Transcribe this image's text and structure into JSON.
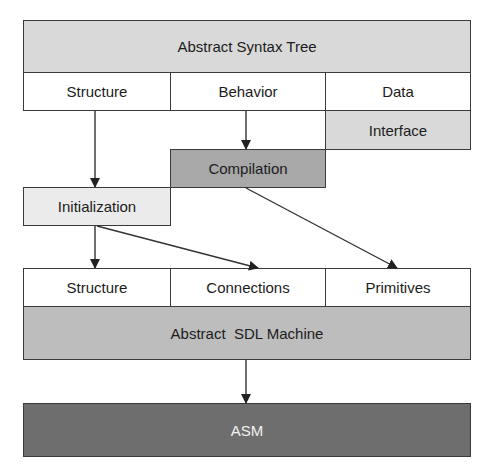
{
  "diagram": {
    "top": {
      "title": "Abstract Syntax Tree",
      "columns": [
        "Structure",
        "Behavior",
        "Data"
      ],
      "interface": "Interface"
    },
    "middle": {
      "compilation": "Compilation",
      "initialization": "Initialization"
    },
    "bottom": {
      "columns": [
        "Structure",
        "Connections",
        "Primitives"
      ],
      "machine": "Abstract  SDL Machine",
      "asm": "ASM"
    },
    "edges": [
      {
        "from": "Structure",
        "to": "Initialization"
      },
      {
        "from": "Behavior",
        "to": "Compilation"
      },
      {
        "from": "Initialization",
        "to": "Structure (machine)"
      },
      {
        "from": "Initialization",
        "to": "Connections"
      },
      {
        "from": "Compilation",
        "to": "Primitives"
      },
      {
        "from": "Abstract SDL Machine",
        "to": "ASM"
      }
    ],
    "colors": {
      "ast": "#d9d9d9",
      "compilation": "#a8a8a8",
      "initialization": "#ebebeb",
      "sdl_machine": "#bdbdbd",
      "asm": "#6e6e6e"
    }
  }
}
